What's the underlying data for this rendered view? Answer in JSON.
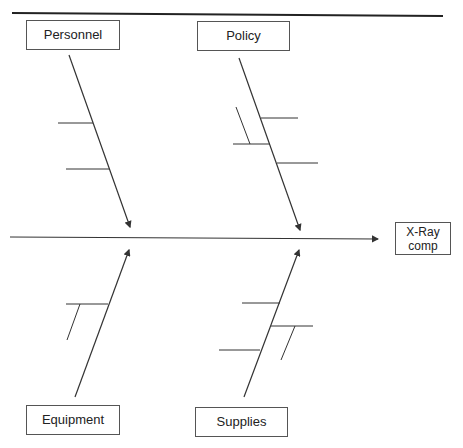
{
  "diagram": {
    "type": "fishbone",
    "effect": {
      "label_line1": "X-Ray",
      "label_line2": "comp"
    },
    "categories": [
      {
        "label": "Personnel",
        "position": "top-left",
        "sub_causes": 2
      },
      {
        "label": "Policy",
        "position": "top-right",
        "sub_causes": 3
      },
      {
        "label": "Equipment",
        "position": "bottom-left",
        "sub_causes": 1
      },
      {
        "label": "Supplies",
        "position": "bottom-right",
        "sub_causes": 3
      }
    ]
  },
  "colors": {
    "line": "#333333",
    "box_border": "#555555",
    "text": "#222222"
  }
}
